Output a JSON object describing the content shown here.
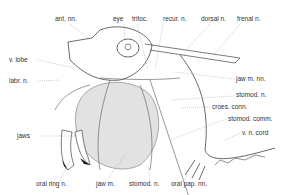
{
  "figure": {
    "labels": {
      "ant_nn": "ant. nn.",
      "eye": "eye",
      "tritoc": "tritoc.",
      "recur_n": "recur. n.",
      "dorsal_n": "dorsal n.",
      "frenal_n": "frenal n.",
      "v_lobe": "v. lobe",
      "labr_n": "labr. n.",
      "jaw_m_nn": "jaw m. nn.",
      "stomod_n_right": "stomod. n.",
      "croes_conn": "croes. conn.",
      "stomod_comm": "stomod. comm.",
      "v_n_cord": "v. n. cord",
      "jaws": "jaws",
      "oral_ring_n": "oral ring n.",
      "jaw_m": "jaw m.",
      "stomod_n_bottom": "stomod. n.",
      "oral_pap_nn": "oral pap. nn."
    }
  }
}
